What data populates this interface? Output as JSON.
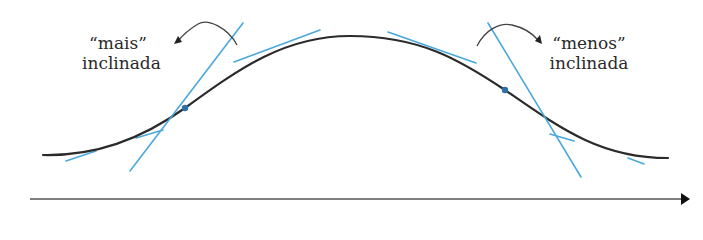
{
  "labels": {
    "left": {
      "line1": "“mais”",
      "line2": "inclinada"
    },
    "right": {
      "line1": "“menos”",
      "line2": "inclinada"
    }
  },
  "colors": {
    "curve": "#2b2b2b",
    "tangent": "#4aa8dd",
    "point": "#2f6fa8",
    "axis": "#333333",
    "annotation_arrow": "#444444"
  },
  "diagram": {
    "axis": {
      "direction": "horizontal",
      "arrow": "right"
    },
    "marked_points": [
      {
        "name": "left-inflection",
        "x": 185,
        "y": 108
      },
      {
        "name": "right-inflection",
        "x": 505,
        "y": 90
      }
    ]
  }
}
